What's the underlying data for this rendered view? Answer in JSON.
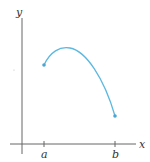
{
  "diagram": {
    "axes": {
      "x_label": "x",
      "y_label": "y",
      "color": "#555555"
    },
    "ticks": [
      {
        "label": "a",
        "x": 44
      },
      {
        "label": "b",
        "x": 115
      }
    ],
    "curve": {
      "color": "#5bb8e0",
      "description": "continuous function on closed interval [a, b]",
      "start_point": {
        "x": 44,
        "y": 65
      },
      "peak": {
        "x": 68,
        "y": 48
      },
      "end_point": {
        "x": 115,
        "y": 116
      }
    }
  }
}
